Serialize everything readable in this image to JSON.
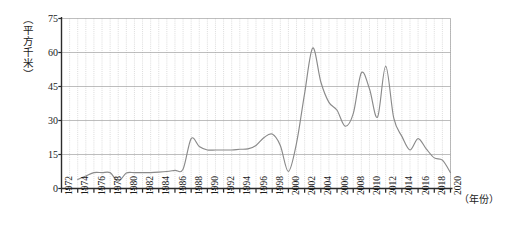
{
  "chart_data": {
    "type": "line",
    "title": "",
    "subtitle": "",
    "xlabel": "（年份）",
    "ylabel": "（平方千米）",
    "xlim": [
      1972,
      2020
    ],
    "ylim": [
      0,
      75
    ],
    "y_ticks": [
      0,
      15,
      30,
      45,
      60,
      75
    ],
    "x_ticks": [
      1972,
      1974,
      1976,
      1978,
      1980,
      1982,
      1984,
      1986,
      1988,
      1990,
      1992,
      1994,
      1996,
      1998,
      2000,
      2002,
      2004,
      2006,
      2008,
      2010,
      2012,
      2014,
      2016,
      2018,
      2020
    ],
    "x_tick_labels": [
      "1972",
      "1974",
      "1976",
      "1978",
      "1980",
      "1982",
      "1984",
      "1986",
      "1988",
      "1990",
      "1992",
      "1994",
      "1996",
      "1998",
      "2000",
      "2002",
      "2004",
      "2006",
      "2008",
      "2010",
      "2012",
      "2014",
      "2016",
      "2018",
      "2020"
    ],
    "y_tick_labels": [
      "0",
      "15",
      "30",
      "45",
      "60",
      "75"
    ],
    "grid": {
      "horizontal_major": true,
      "vertical_minor_dotted": true,
      "vertical_step_years": 1
    },
    "legend": {
      "visible": false,
      "position": "none",
      "entries": []
    },
    "series": [
      {
        "name": "面积",
        "color": "#8a8a8a",
        "x": [
          1974,
          1975,
          1976,
          1977,
          1978,
          1979,
          1980,
          1981,
          1982,
          1983,
          1984,
          1985,
          1986,
          1987,
          1988,
          1989,
          1990,
          1991,
          1992,
          1993,
          1994,
          1995,
          1996,
          1997,
          1998,
          1999,
          2000,
          2001,
          2002,
          2003,
          2004,
          2005,
          2006,
          2007,
          2008,
          2009,
          2010,
          2011,
          2012,
          2013,
          2014,
          2015,
          2016,
          2017,
          2018,
          2019,
          2020
        ],
        "values": [
          4.0,
          5.5,
          7.0,
          7.0,
          7.0,
          3.2,
          6.8,
          7.0,
          7.0,
          7.0,
          7.2,
          7.5,
          8.0,
          8.5,
          22.0,
          18.5,
          17.0,
          17.0,
          17.0,
          17.0,
          17.3,
          17.5,
          19.0,
          22.5,
          24.0,
          19.0,
          7.5,
          20.0,
          42.0,
          62.0,
          47.0,
          38.0,
          34.5,
          27.5,
          33.0,
          51.0,
          44.0,
          31.5,
          54.0,
          31.0,
          23.0,
          17.0,
          22.0,
          17.5,
          13.5,
          12.5,
          7.0
        ]
      }
    ]
  },
  "axis": {
    "y_unit_caption": "（平方千米）",
    "x_unit_caption": "（年份）"
  },
  "style": {
    "line_color": "#8a8a8a",
    "major_grid_color": "#9a9a9a",
    "minor_grid_color": "#c4c4c4",
    "axis_color": "#2b2b2b",
    "background": "#ffffff",
    "text_color": "#1a1a1a"
  }
}
